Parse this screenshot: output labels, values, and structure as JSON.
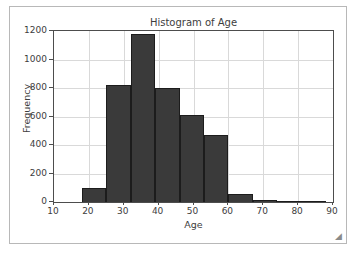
{
  "figure": {
    "resize_handle_glyph": "◢"
  },
  "chart_data": {
    "type": "bar",
    "title": "Histogram of Age",
    "xlabel": "Age",
    "ylabel": "Frequency",
    "xlim": [
      10,
      90
    ],
    "ylim": [
      0,
      1200
    ],
    "grid": true,
    "legend": null,
    "bar_color": "#3a3a3a",
    "edge_color": "#1c1c1c",
    "xticks": [
      10,
      20,
      30,
      40,
      50,
      60,
      70,
      80,
      90
    ],
    "xtick_labels": [
      "10",
      "20",
      "30",
      "40",
      "50",
      "60",
      "70",
      "80",
      "90"
    ],
    "yticks": [
      0,
      200,
      400,
      600,
      800,
      1000,
      1200
    ],
    "ytick_labels": [
      "0",
      "200",
      "400",
      "600",
      "800",
      "1000",
      "1200"
    ],
    "bin_edges": [
      18,
      25,
      32,
      39,
      46,
      53,
      60,
      67,
      74,
      81,
      88
    ],
    "values": [
      100,
      820,
      1180,
      800,
      610,
      470,
      55,
      12,
      10,
      5
    ]
  }
}
